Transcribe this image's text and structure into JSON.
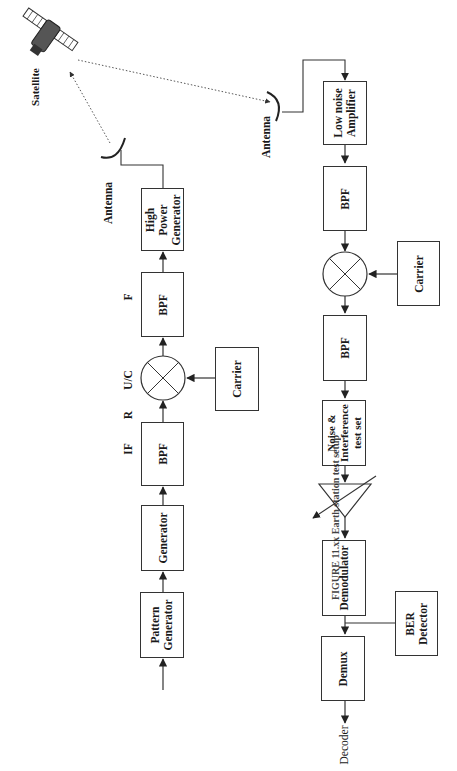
{
  "diagram": {
    "type": "satellite link test block diagram",
    "orientation": "rotated 90 degrees counter-clockwise",
    "satellite_label": "Satellite",
    "uplink": {
      "antenna_label": "Antenna",
      "blocks": {
        "pattern_generator": "Pattern Generator",
        "generator": "Generator",
        "bpf_if": "BPF",
        "mixer": "mixer",
        "bpf_rf": "BPF",
        "high_power_generator": "High Power Generator",
        "carrier": "Carrier"
      },
      "signal_labels": {
        "if": "IF",
        "r": "R",
        "uc": "U/C",
        "f": "F"
      }
    },
    "downlink": {
      "antenna_label": "Antenna",
      "blocks": {
        "low_noise_amplifier": "Low noise Amplifier",
        "bpf_1": "BPF",
        "mixer": "mixer",
        "carrier": "Carrier",
        "bpf_2": "BPF",
        "noise_interference": "Noise & Interference test set",
        "variable_attenuator": "variable amplifier",
        "demodulator": "Demodulator",
        "ber_detector": "BER Detector",
        "demux": "Demux"
      },
      "output_label": "Decoder"
    },
    "caption": "FIGURE 11.xx  Earth station test setup",
    "colors": {
      "line": "#333333",
      "background": "#ffffff",
      "text": "#1a1a1a"
    }
  }
}
